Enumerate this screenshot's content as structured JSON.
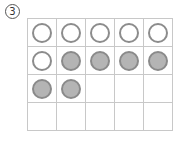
{
  "problem": {
    "number": "3"
  },
  "ten_frame": {
    "rows": 4,
    "cols": 5,
    "cells": [
      [
        "empty",
        "empty",
        "empty",
        "empty",
        "empty"
      ],
      [
        "empty",
        "filled",
        "filled",
        "filled",
        "filled"
      ],
      [
        "filled",
        "filled",
        "none",
        "none",
        "none"
      ],
      [
        "none",
        "none",
        "none",
        "none",
        "none"
      ]
    ],
    "counts": {
      "empty": 6,
      "filled": 6
    },
    "colors": {
      "grid_line": "#c8c8c8",
      "empty_stroke": "#8c8c8c",
      "filled_fill": "#b4b4b4",
      "filled_stroke": "#8a8a8a"
    }
  }
}
